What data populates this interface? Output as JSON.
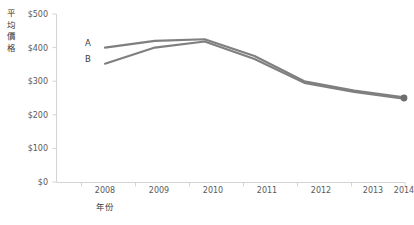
{
  "chart_data": {
    "type": "line",
    "title": "",
    "xlabel": "年份",
    "ylabel": "平均價格",
    "x": [
      2008,
      2009,
      2010,
      2011,
      2012,
      2013,
      2014
    ],
    "categories": [
      "2008",
      "2009",
      "2010",
      "2011",
      "2012",
      "2013",
      "2014"
    ],
    "series": [
      {
        "name": "A",
        "values": [
          400,
          420,
          425,
          375,
          300,
          272,
          252
        ]
      },
      {
        "name": "B",
        "values": [
          352,
          400,
          418,
          366,
          295,
          268,
          248
        ]
      }
    ],
    "ylim": [
      0,
      500
    ],
    "y_ticks": [
      0,
      100,
      200,
      300,
      400,
      500
    ],
    "y_tick_labels": [
      "$0",
      "$100",
      "$200",
      "$300",
      "$400",
      "$500"
    ],
    "x_tick_labels": [
      "2008",
      "2009",
      "2010",
      "2011",
      "2012",
      "2013",
      "2014"
    ],
    "grid": false,
    "legend": "inline-labels",
    "legend_entries": [
      "A",
      "B"
    ],
    "series_color": "#7f7f7f",
    "axis_color": "#d4d4d4",
    "text_color": "#5a5a5a",
    "end_marker": true
  },
  "axis": {
    "y_title_chars": [
      "平",
      "均",
      "價",
      "格"
    ],
    "x_title": "年份"
  }
}
